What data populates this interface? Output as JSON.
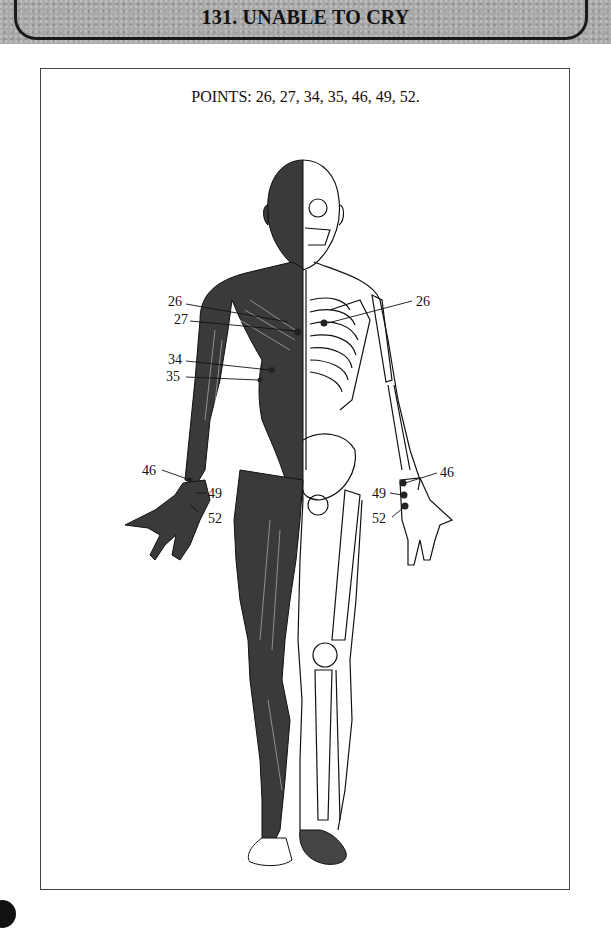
{
  "header": {
    "title": "131. UNABLE TO CRY"
  },
  "figure": {
    "caption": "POINTS: 26, 27, 34, 35, 46, 49, 52.",
    "points": [
      26,
      27,
      34,
      35,
      46,
      49,
      52
    ],
    "labels_left": [
      {
        "id": "26",
        "text": "26"
      },
      {
        "id": "27",
        "text": "27"
      },
      {
        "id": "34",
        "text": "34"
      },
      {
        "id": "35",
        "text": "35"
      },
      {
        "id": "46",
        "text": "46"
      },
      {
        "id": "49",
        "text": "49"
      },
      {
        "id": "52",
        "text": "52"
      }
    ],
    "labels_right": [
      {
        "id": "26",
        "text": "26"
      },
      {
        "id": "46",
        "text": "46"
      },
      {
        "id": "49",
        "text": "49"
      },
      {
        "id": "52",
        "text": "52"
      }
    ],
    "illustration": "front-view-human-body-half-muscle-half-skeleton"
  },
  "colors": {
    "header_band": "#a9a9a9",
    "ink": "#111111",
    "muscle": "#3a3a3a",
    "paper": "#ffffff"
  }
}
